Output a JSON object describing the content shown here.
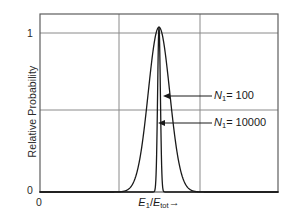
{
  "chart_data": {
    "type": "line",
    "title": "",
    "xlabel": "E1/Etot",
    "xlabel_parts": {
      "num": "E",
      "num_sub": "1",
      "den": "E",
      "den_sub": "tot",
      "arrow": "→"
    },
    "ylabel": "Relative Probability",
    "xlim": [
      0,
      1
    ],
    "ylim": [
      0,
      1.08
    ],
    "xticks": [
      "0"
    ],
    "yticks": [
      "0",
      "1"
    ],
    "ytick_values": [
      0,
      1
    ],
    "grid": true,
    "gridlines": {
      "vertical_x": [
        0.33,
        0.67
      ],
      "horizontal_y": [
        0.52,
        1.0
      ]
    },
    "legend_position": "inline-annotations",
    "series": [
      {
        "name": "N1 = 100",
        "label_parts": {
          "symbol": "N",
          "sub": "1",
          "eq": "= 100"
        },
        "center": 0.5,
        "sigma": 0.045,
        "peak": 1.0,
        "color": "#1a1a1a"
      },
      {
        "name": "N1 = 10000",
        "label_parts": {
          "symbol": "N",
          "sub": "1",
          "eq": "= 10000"
        },
        "center": 0.5,
        "sigma": 0.0058,
        "peak": 1.0,
        "color": "#1a1a1a"
      }
    ],
    "annotations": [
      {
        "text": "N1 = 100",
        "arrow_from_x": 0.76,
        "arrow_to_x": 0.535,
        "y": 0.585
      },
      {
        "text": "N1 = 10000",
        "arrow_from_x": 0.76,
        "arrow_to_x": 0.497,
        "y": 0.415
      }
    ],
    "colors": {
      "curve": "#1a1a1a",
      "frame": "#6e6e6e",
      "grid": "#7a7a7a",
      "background": "#ffffff",
      "text": "#1a1a1a"
    }
  }
}
